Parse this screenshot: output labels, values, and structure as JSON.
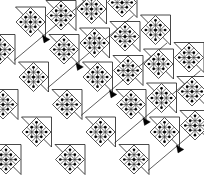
{
  "figure": {
    "width": 204,
    "height": 183,
    "background_color": "#ffffff",
    "line_color": "#1a1a1a",
    "motif_line_color": "#2b2b2b",
    "arrow_color": "#000000",
    "dot_color": "#000000"
  },
  "geometry": {
    "unit_step_x": 33.5,
    "unit_step_y": 27.5,
    "diagonal_shift_x": 18.0,
    "diagonal_shift_y": 21.0,
    "motif_half_size": 14.5,
    "triangle_leg": 30.0,
    "motif_grid_divisions": 3,
    "rows": 5,
    "cols": 5
  },
  "motif": {
    "name": "patterned-diamond",
    "description": "Square rotated 45 degrees subdivided into a 3 by 3 lattice of small diamonds with dots at the lattice intersections",
    "subdivisions": 3,
    "dot_radius": 1.5,
    "dot_count": 9
  },
  "arrow": {
    "name": "direction-marker",
    "description": "Small solid black triangle pointing down-right along the diagonal",
    "size": 7.5,
    "count": 7
  },
  "cells": [
    {
      "id": "c-0-0",
      "col": 0,
      "row": 0,
      "x": 30.5,
      "y": 22.0,
      "triangle": "upper-left",
      "arrow": true,
      "arrow_x": 46.0,
      "arrow_y": 39.0
    },
    {
      "id": "c-1-0",
      "col": 1,
      "row": 0,
      "x": 64.0,
      "y": 49.5,
      "triangle": "upper-left",
      "arrow": true,
      "arrow_x": 79.5,
      "arrow_y": 66.5
    },
    {
      "id": "c-2-0",
      "col": 2,
      "row": 0,
      "x": 97.5,
      "y": 77.0,
      "triangle": "upper-left",
      "arrow": true,
      "arrow_x": 113.0,
      "arrow_y": 94.0
    },
    {
      "id": "c-3-0",
      "col": 3,
      "row": 0,
      "x": 131.0,
      "y": 104.5,
      "triangle": "upper-left",
      "arrow": true,
      "arrow_x": 146.5,
      "arrow_y": 121.5
    },
    {
      "id": "c-4-0",
      "col": 4,
      "row": 0,
      "x": 164.5,
      "y": 132.0,
      "triangle": "upper-left",
      "arrow": true,
      "arrow_x": 180.0,
      "arrow_y": 149.0
    },
    {
      "id": "c-0-1",
      "col": 0,
      "row": 1,
      "x": 61.0,
      "y": 15.5,
      "triangle": "upper-left",
      "arrow": false,
      "arrow_x": 0,
      "arrow_y": 0
    },
    {
      "id": "c-1-1",
      "col": 1,
      "row": 1,
      "x": 94.5,
      "y": 43.0,
      "triangle": "upper-left",
      "arrow": false,
      "arrow_x": 0,
      "arrow_y": 0
    },
    {
      "id": "c-2-1",
      "col": 2,
      "row": 1,
      "x": 128.0,
      "y": 70.5,
      "triangle": "upper-left",
      "arrow": false,
      "arrow_x": 0,
      "arrow_y": 0
    },
    {
      "id": "c-3-1",
      "col": 3,
      "row": 1,
      "x": 161.5,
      "y": 98.0,
      "triangle": "upper-left",
      "arrow": false,
      "arrow_x": 0,
      "arrow_y": 0
    },
    {
      "id": "c-4-1",
      "col": 4,
      "row": 1,
      "x": 195.0,
      "y": 125.5,
      "triangle": "upper-left",
      "arrow": false,
      "arrow_x": 0,
      "arrow_y": 0
    },
    {
      "id": "c-0-2",
      "col": 0,
      "row": 2,
      "x": 91.5,
      "y": 9.0,
      "triangle": "upper-left",
      "arrow": false,
      "arrow_x": 0,
      "arrow_y": 0
    },
    {
      "id": "c-1-2",
      "col": 1,
      "row": 2,
      "x": 125.0,
      "y": 36.5,
      "triangle": "upper-left",
      "arrow": false,
      "arrow_x": 0,
      "arrow_y": 0
    },
    {
      "id": "c-2-2",
      "col": 2,
      "row": 2,
      "x": 158.5,
      "y": 64.0,
      "triangle": "upper-left",
      "arrow": false,
      "arrow_x": 0,
      "arrow_y": 0
    },
    {
      "id": "c-3-2",
      "col": 3,
      "row": 2,
      "x": 192.0,
      "y": 91.5,
      "triangle": "upper-left",
      "arrow": false,
      "arrow_x": 0,
      "arrow_y": 0
    },
    {
      "id": "c-0-3",
      "col": 0,
      "row": 3,
      "x": 122.0,
      "y": 2.5,
      "triangle": "upper-left",
      "arrow": false,
      "arrow_x": 0,
      "arrow_y": 0
    },
    {
      "id": "c-1-3",
      "col": 1,
      "row": 3,
      "x": 155.5,
      "y": 30.0,
      "triangle": "upper-left",
      "arrow": false,
      "arrow_x": 0,
      "arrow_y": 0
    },
    {
      "id": "c-2-3",
      "col": 2,
      "row": 3,
      "x": 189.0,
      "y": 57.5,
      "triangle": "upper-left",
      "arrow": false,
      "arrow_x": 0,
      "arrow_y": 0
    },
    {
      "id": "c-0-m1",
      "col": -1,
      "row": 0,
      "x": 0.0,
      "y": 49.5,
      "triangle": "upper-left",
      "arrow": false,
      "arrow_x": 0,
      "arrow_y": 0
    },
    {
      "id": "c-0-m2",
      "col": -1,
      "row": 1,
      "x": 33.5,
      "y": 77.0,
      "triangle": "upper-left",
      "arrow": false,
      "arrow_x": 0,
      "arrow_y": 0
    },
    {
      "id": "c-0-m3",
      "col": -1,
      "row": 2,
      "x": 67.0,
      "y": 104.5,
      "triangle": "upper-left",
      "arrow": false,
      "arrow_x": 0,
      "arrow_y": 0
    },
    {
      "id": "c-0-m4",
      "col": -1,
      "row": 3,
      "x": 100.5,
      "y": 132.0,
      "triangle": "upper-left",
      "arrow": false,
      "arrow_x": 0,
      "arrow_y": 0
    },
    {
      "id": "c-0-m5",
      "col": -1,
      "row": 4,
      "x": 134.0,
      "y": 159.5,
      "triangle": "upper-left",
      "arrow": false,
      "arrow_x": 0,
      "arrow_y": 0
    },
    {
      "id": "c-0-n1",
      "col": -2,
      "row": 1,
      "x": 3.0,
      "y": 104.5,
      "triangle": "upper-left",
      "arrow": false,
      "arrow_x": 0,
      "arrow_y": 0
    },
    {
      "id": "c-0-n2",
      "col": -2,
      "row": 2,
      "x": 36.5,
      "y": 132.0,
      "triangle": "upper-left",
      "arrow": false,
      "arrow_x": 0,
      "arrow_y": 0
    },
    {
      "id": "c-0-n3",
      "col": -2,
      "row": 3,
      "x": 70.0,
      "y": 159.5,
      "triangle": "upper-left",
      "arrow": false,
      "arrow_x": 0,
      "arrow_y": 0
    },
    {
      "id": "c-0-p1",
      "col": -3,
      "row": 2,
      "x": 6.0,
      "y": 159.5,
      "triangle": "upper-left",
      "arrow": false,
      "arrow_x": 0,
      "arrow_y": 0
    }
  ],
  "guide_lines": [
    {
      "id": "g0",
      "x1": 14.0,
      "y1": 60.5,
      "x2": 100.0,
      "y2": -12.0
    },
    {
      "id": "g1",
      "x1": 47.5,
      "y1": 88.0,
      "x2": 133.5,
      "y2": 15.5
    },
    {
      "id": "g2",
      "x1": 81.0,
      "y1": 115.5,
      "x2": 167.0,
      "y2": 43.0
    },
    {
      "id": "g3",
      "x1": 114.5,
      "y1": 143.0,
      "x2": 200.5,
      "y2": 70.5
    },
    {
      "id": "g4",
      "x1": 148.0,
      "y1": 170.5,
      "x2": 234.0,
      "y2": 98.0
    }
  ]
}
